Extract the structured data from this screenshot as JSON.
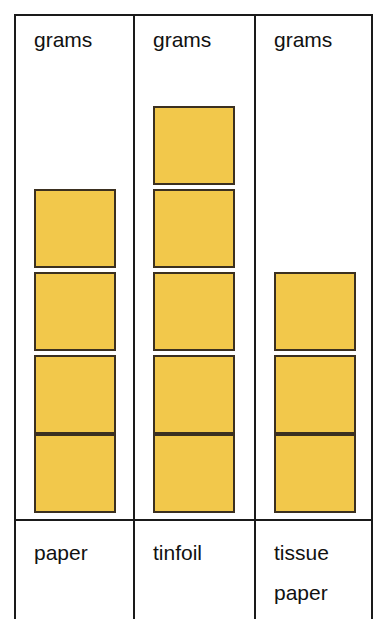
{
  "chart_data": {
    "type": "bar",
    "title": "",
    "subtitle": "",
    "xlabel": "",
    "ylabel": "grams",
    "unit_label": "grams",
    "categories": [
      "paper",
      "tinfoil",
      "tissue paper"
    ],
    "values": [
      4,
      5,
      3
    ],
    "values_unit": "grams",
    "grid": false,
    "legend": null,
    "series": [
      {
        "name": "mass",
        "values": [
          4,
          5,
          3
        ]
      }
    ],
    "colors": {
      "unit_fill": "#f2c84b",
      "unit_border": "#3b3020",
      "table_border": "#1a1a1a",
      "background": "#ffffff",
      "text": "#111111"
    }
  },
  "table": {
    "headers": [
      "grams",
      "grams",
      "grams"
    ],
    "columns": [
      {
        "id": "paper",
        "header": "grams",
        "count": 4,
        "label_lines": [
          "paper"
        ]
      },
      {
        "id": "tinfoil",
        "header": "grams",
        "count": 5,
        "label_lines": [
          "tinfoil"
        ]
      },
      {
        "id": "tissue-paper",
        "header": "grams",
        "count": 3,
        "label_lines": [
          "tissue",
          "paper"
        ]
      }
    ]
  }
}
